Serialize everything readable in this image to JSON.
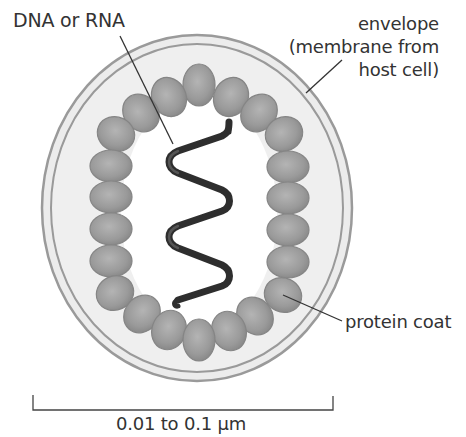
{
  "diagram": {
    "labels": {
      "nucleic_acid": "DNA or RNA",
      "envelope_line1": "envelope",
      "envelope_line2": "(membrane from",
      "envelope_line3": "host cell)",
      "protein_coat": "protein coat",
      "scale": "0.01 to 0.1 µm"
    },
    "colors": {
      "envelope_fill": "#ececec",
      "envelope_stroke": "#9a9a9a",
      "capsomere_fill": "#9c9c9c",
      "capsomere_stroke": "#7f7f7f",
      "helix": "#3a3a3a",
      "text": "#333333",
      "interior": "#ffffff"
    },
    "capsomere_count": 22
  }
}
